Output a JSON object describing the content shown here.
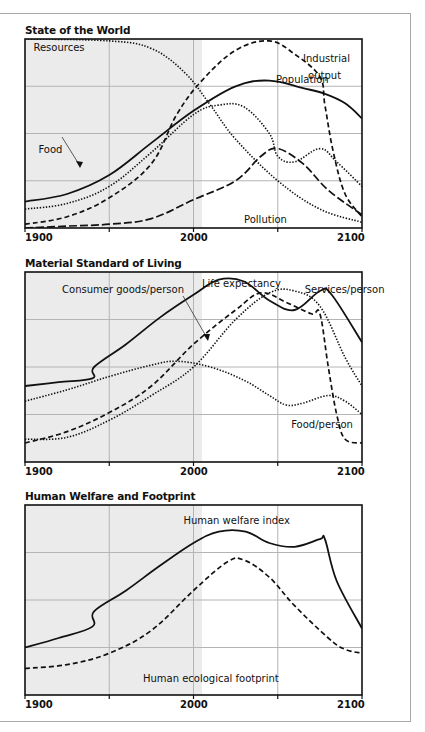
{
  "panels": [
    {
      "title": "State of the World",
      "ticks": [
        "1900",
        "2000",
        "2100"
      ]
    },
    {
      "title": "Material Standard of Living",
      "ticks": [
        "1900",
        "2000",
        "2100"
      ]
    },
    {
      "title": "Human Welfare and Footprint",
      "ticks": [
        "1900",
        "2000",
        "2100"
      ]
    }
  ],
  "chart_data": [
    {
      "type": "line",
      "title": "State of the World",
      "xlabel": "",
      "ylabel": "",
      "xlim": [
        1900,
        2100
      ],
      "ylim": [
        0,
        100
      ],
      "x_ticks": [
        1900,
        2000,
        2100
      ],
      "grid": true,
      "shaded_region": [
        1900,
        2005
      ],
      "series": [
        {
          "name": "Resources",
          "style": "dotted",
          "points": [
            [
              1900,
              100
            ],
            [
              1950,
              99
            ],
            [
              1975,
              95
            ],
            [
              1995,
              82
            ],
            [
              2010,
              65
            ],
            [
              2025,
              47
            ],
            [
              2050,
              25
            ],
            [
              2075,
              10
            ],
            [
              2100,
              3
            ]
          ]
        },
        {
          "name": "Industrial output",
          "style": "dashed",
          "points": [
            [
              1900,
              2
            ],
            [
              1925,
              6
            ],
            [
              1950,
              16
            ],
            [
              1975,
              34
            ],
            [
              1990,
              60
            ],
            [
              2005,
              78
            ],
            [
              2025,
              94
            ],
            [
              2045,
              99
            ],
            [
              2060,
              92
            ],
            [
              2075,
              80
            ],
            [
              2078,
              65
            ],
            [
              2083,
              40
            ],
            [
              2090,
              18
            ],
            [
              2100,
              6
            ]
          ]
        },
        {
          "name": "Population",
          "style": "solid",
          "points": [
            [
              1900,
              14
            ],
            [
              1925,
              18
            ],
            [
              1950,
              28
            ],
            [
              1975,
              45
            ],
            [
              2000,
              62
            ],
            [
              2025,
              75
            ],
            [
              2045,
              78
            ],
            [
              2065,
              74
            ],
            [
              2078,
              71
            ],
            [
              2090,
              66
            ],
            [
              2100,
              58
            ]
          ]
        },
        {
          "name": "Food",
          "style": "dotted",
          "points": [
            [
              1900,
              10
            ],
            [
              1925,
              13
            ],
            [
              1950,
              22
            ],
            [
              1975,
              40
            ],
            [
              2000,
              60
            ],
            [
              2015,
              65
            ],
            [
              2030,
              64
            ],
            [
              2045,
              50
            ],
            [
              2050,
              38
            ],
            [
              2060,
              35
            ],
            [
              2075,
              42
            ],
            [
              2085,
              35
            ],
            [
              2100,
              22
            ]
          ]
        },
        {
          "name": "Pollution",
          "style": "long-dash",
          "points": [
            [
              1900,
              0
            ],
            [
              1925,
              1
            ],
            [
              1950,
              2
            ],
            [
              1975,
              5
            ],
            [
              2000,
              15
            ],
            [
              2025,
              25
            ],
            [
              2040,
              38
            ],
            [
              2050,
              42
            ],
            [
              2065,
              34
            ],
            [
              2080,
              20
            ],
            [
              2100,
              7
            ]
          ]
        }
      ]
    },
    {
      "type": "line",
      "title": "Material Standard of Living",
      "xlabel": "",
      "ylabel": "",
      "xlim": [
        1900,
        2100
      ],
      "ylim": [
        0,
        100
      ],
      "x_ticks": [
        1900,
        2000,
        2100
      ],
      "grid": true,
      "shaded_region": [
        1900,
        2005
      ],
      "series": [
        {
          "name": "Life expectancy",
          "style": "solid",
          "points": [
            [
              1900,
              40
            ],
            [
              1920,
              42
            ],
            [
              1940,
              44
            ],
            [
              1941,
              50
            ],
            [
              1960,
              62
            ],
            [
              1980,
              76
            ],
            [
              2000,
              88
            ],
            [
              2015,
              96
            ],
            [
              2030,
              95
            ],
            [
              2045,
              85
            ],
            [
              2060,
              80
            ],
            [
              2075,
              90
            ],
            [
              2082,
              88
            ],
            [
              2100,
              63
            ]
          ]
        },
        {
          "name": "Consumer goods/person",
          "style": "dashed",
          "points": [
            [
              1900,
              10
            ],
            [
              1925,
              16
            ],
            [
              1950,
              26
            ],
            [
              1975,
              40
            ],
            [
              2000,
              62
            ],
            [
              2025,
              80
            ],
            [
              2040,
              89
            ],
            [
              2055,
              84
            ],
            [
              2070,
              78
            ],
            [
              2075,
              78
            ],
            [
              2080,
              50
            ],
            [
              2085,
              25
            ],
            [
              2090,
              12
            ],
            [
              2100,
              10
            ]
          ]
        },
        {
          "name": "Services/person",
          "style": "dotted",
          "points": [
            [
              1900,
              12
            ],
            [
              1925,
              13
            ],
            [
              1950,
              22
            ],
            [
              1975,
              35
            ],
            [
              2000,
              50
            ],
            [
              2025,
              75
            ],
            [
              2045,
              89
            ],
            [
              2060,
              90
            ],
            [
              2075,
              82
            ],
            [
              2090,
              55
            ],
            [
              2100,
              40
            ]
          ]
        },
        {
          "name": "Food/person",
          "style": "dotted",
          "points": [
            [
              1900,
              32
            ],
            [
              1925,
              38
            ],
            [
              1950,
              45
            ],
            [
              1975,
              51
            ],
            [
              1990,
              53
            ],
            [
              2010,
              50
            ],
            [
              2030,
              43
            ],
            [
              2045,
              35
            ],
            [
              2055,
              30
            ],
            [
              2065,
              31
            ],
            [
              2080,
              35
            ],
            [
              2090,
              32
            ],
            [
              2100,
              25
            ]
          ]
        }
      ]
    },
    {
      "type": "line",
      "title": "Human Welfare and Footprint",
      "xlabel": "",
      "ylabel": "",
      "xlim": [
        1900,
        2100
      ],
      "ylim": [
        0,
        100
      ],
      "x_ticks": [
        1900,
        2000,
        2100
      ],
      "grid": true,
      "shaded_region": [
        1900,
        2005
      ],
      "series": [
        {
          "name": "Human welfare index",
          "style": "solid",
          "points": [
            [
              1900,
              25
            ],
            [
              1920,
              30
            ],
            [
              1940,
              36
            ],
            [
              1941,
              44
            ],
            [
              1960,
              55
            ],
            [
              1980,
              68
            ],
            [
              2000,
              80
            ],
            [
              2015,
              86
            ],
            [
              2031,
              86
            ],
            [
              2045,
              80
            ],
            [
              2060,
              78
            ],
            [
              2075,
              82
            ],
            [
              2078,
              82
            ],
            [
              2085,
              60
            ],
            [
              2100,
              35
            ]
          ]
        },
        {
          "name": "Human ecological footprint",
          "style": "dashed",
          "points": [
            [
              1900,
              14
            ],
            [
              1925,
              16
            ],
            [
              1950,
              22
            ],
            [
              1975,
              34
            ],
            [
              2000,
              55
            ],
            [
              2020,
              70
            ],
            [
              2030,
              71
            ],
            [
              2045,
              62
            ],
            [
              2060,
              47
            ],
            [
              2080,
              30
            ],
            [
              2090,
              24
            ],
            [
              2100,
              22
            ]
          ]
        }
      ]
    }
  ],
  "annotations": [
    [
      {
        "text": "Resources",
        "x": 1905,
        "y": 96
      },
      {
        "text": "Industrial",
        "x": 2065,
        "y": 90
      },
      {
        "text": "output",
        "x": 2068,
        "y": 81
      },
      {
        "text": "Population",
        "x": 2049,
        "y": 79
      },
      {
        "text": "Food",
        "x": 1908,
        "y": 42
      },
      {
        "text": "Pollution",
        "x": 2030,
        "y": 5
      }
    ],
    [
      {
        "text": "Consumer goods/person",
        "x": 1922,
        "y": 91
      },
      {
        "text": "Life expectancy",
        "x": 2005,
        "y": 94
      },
      {
        "text": "Services/person",
        "x": 2066,
        "y": 91
      },
      {
        "text": "Food/person",
        "x": 2058,
        "y": 20
      }
    ],
    [
      {
        "text": "Human welfare index",
        "x": 1994,
        "y": 92
      },
      {
        "text": "Human ecological footprint",
        "x": 1970,
        "y": 9
      }
    ]
  ]
}
